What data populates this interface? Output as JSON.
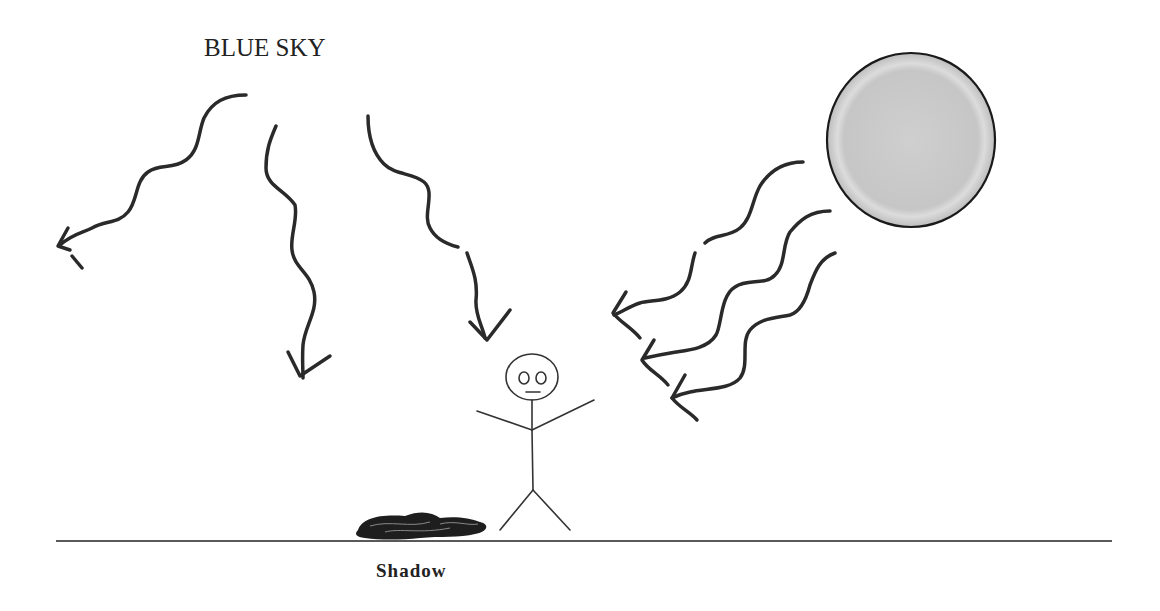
{
  "diagram": {
    "sky_label": "BLUE SKY",
    "shadow_label": "Shadow",
    "elements": {
      "sun": "sun-circle",
      "person": "stick-figure",
      "shadow": "scribbled-shadow",
      "ground": "ground-line",
      "sky_rays": 3,
      "sun_rays": 3
    },
    "colors": {
      "background": "#ffffff",
      "stroke": "#2a2a2a",
      "sun_fill": "#c8c8c8",
      "sun_edge": "#1a1a1a"
    }
  }
}
